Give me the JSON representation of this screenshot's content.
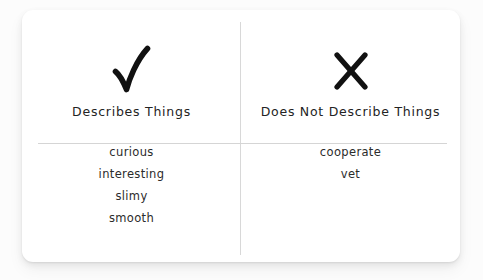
{
  "card": {
    "title": "Sorting Chart",
    "columns": [
      {
        "symbol_name": "checkmark-icon",
        "symbol_char": "✓",
        "header": "Describes Things",
        "words": [
          "curious",
          "interesting",
          "slimy",
          "smooth"
        ]
      },
      {
        "symbol_name": "cross-icon",
        "symbol_char": "✗",
        "header": "Does Not Describe Things",
        "words": [
          "cooperate",
          "vet"
        ]
      }
    ]
  },
  "colors": {
    "page_background": "#fdfdfd",
    "card_background": "#ffffff",
    "divider": "#d6d6d6",
    "text": "#232323",
    "symbol": "#111111"
  }
}
